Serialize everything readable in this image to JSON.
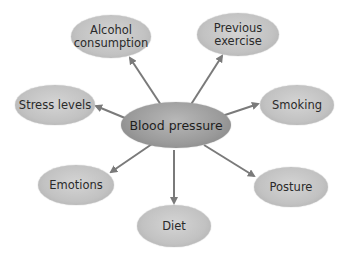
{
  "diagram": {
    "type": "spider-diagram",
    "center": {
      "label": "Blood pressure"
    },
    "nodes": [
      {
        "id": "alcohol",
        "label": "Alcohol consumption",
        "line1": "Alcohol",
        "line2": "consumption"
      },
      {
        "id": "exercise",
        "label": "Previous exercise",
        "line1": "Previous",
        "line2": "exercise"
      },
      {
        "id": "stress",
        "label": "Stress levels"
      },
      {
        "id": "smoking",
        "label": "Smoking"
      },
      {
        "id": "emotions",
        "label": "Emotions"
      },
      {
        "id": "posture",
        "label": "Posture"
      },
      {
        "id": "diet",
        "label": "Diet"
      }
    ],
    "edges": [
      {
        "from": "Blood pressure",
        "to": "Alcohol consumption"
      },
      {
        "from": "Blood pressure",
        "to": "Previous exercise"
      },
      {
        "from": "Blood pressure",
        "to": "Stress levels"
      },
      {
        "from": "Blood pressure",
        "to": "Smoking"
      },
      {
        "from": "Blood pressure",
        "to": "Emotions"
      },
      {
        "from": "Blood pressure",
        "to": "Posture"
      },
      {
        "from": "Blood pressure",
        "to": "Diet"
      }
    ],
    "colors": {
      "node_fill": "#c4c4c4",
      "center_fill": "#9c9c9c",
      "arrow": "#7a7a7a",
      "text": "#2a2a2a",
      "background": "#ffffff"
    }
  }
}
